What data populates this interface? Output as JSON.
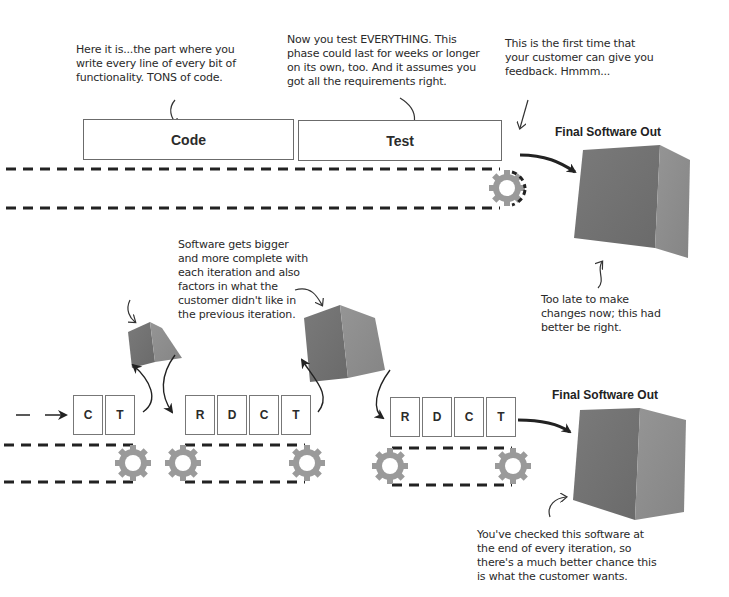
{
  "waterfall": {
    "annotations": {
      "code_note": "Here it is...the part where you\nwrite every line of every bit of\nfunctionality. TONS of code.",
      "test_note": "Now you test EVERYTHING. This\nphase could last for weeks or longer\non its own, too. And it assumes you\ngot all the requirements right.",
      "feedback_note": "This is the first time that\nyour customer can give you\nfeedback. Hmmm...",
      "too_late_note": "Too late to make\nchanges now; this had\nbetter be right."
    },
    "phases": [
      "Code",
      "Test"
    ],
    "final_label": "Final Software Out"
  },
  "iterative": {
    "annotations": {
      "growth_note": "Software gets bigger\nand more complete with\neach iteration and also\nfactors in what the\ncustomer didn't like in\nthe previous iteration.",
      "checked_note": "You've checked this software at\nthe end of every iteration, so\nthere's a much better chance this\nis what the customer wants."
    },
    "iteration_1": [
      "C",
      "T"
    ],
    "iteration_2": [
      "R",
      "D",
      "C",
      "T"
    ],
    "iteration_3": [
      "R",
      "D",
      "C",
      "T"
    ],
    "final_label": "Final Software Out"
  },
  "colors": {
    "box_dark": "#6e6e6e",
    "box_light": "#8a8a8a",
    "gear": "#9a9a9a",
    "ink": "#2a2a2a"
  }
}
